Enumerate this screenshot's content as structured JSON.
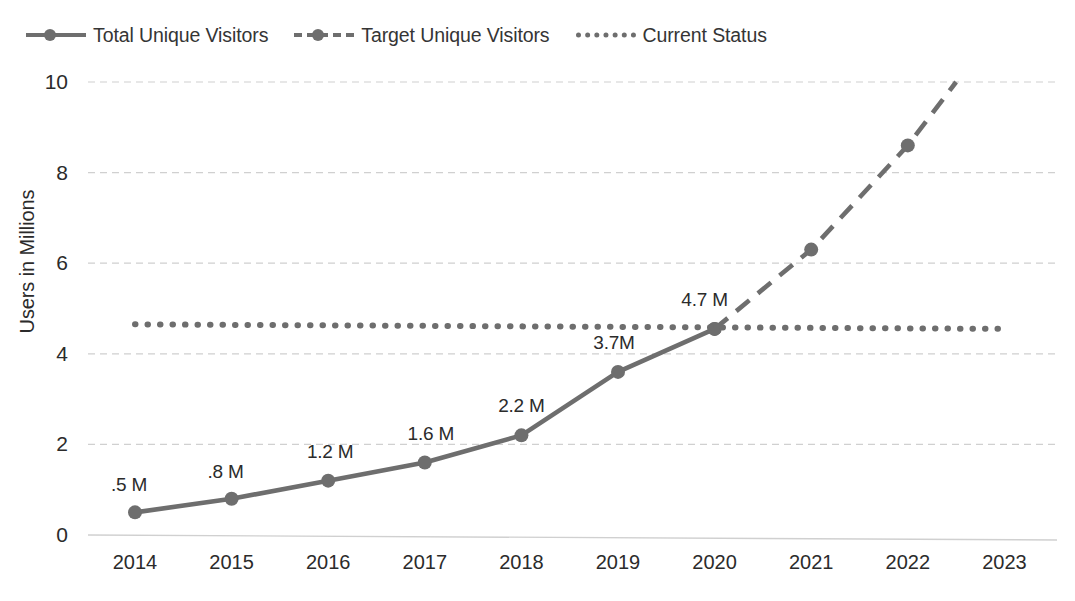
{
  "chart_data": {
    "type": "line",
    "title": "",
    "xlabel": "",
    "ylabel": "Users in Millions",
    "categories": [
      "2014",
      "2015",
      "2016",
      "2017",
      "2018",
      "2019",
      "2020",
      "2021",
      "2022",
      "2023"
    ],
    "ylim": [
      0,
      10
    ],
    "yticks": [
      "0",
      "2",
      "4",
      "6",
      "8",
      "10"
    ],
    "grid": true,
    "legend_position": "top-left",
    "series": [
      {
        "name": "Total Unique Visitors",
        "style": "solid",
        "color": "#6e6e6e",
        "x": [
          "2014",
          "2015",
          "2016",
          "2017",
          "2018",
          "2019",
          "2020"
        ],
        "values": [
          0.5,
          0.8,
          1.2,
          1.6,
          2.2,
          3.6,
          4.55
        ],
        "labels": [
          ".5 M",
          ".8 M",
          "1.2 M",
          "1.6 M",
          "2.2 M",
          "3.7M",
          "4.7 M"
        ]
      },
      {
        "name": "Target Unique Visitors",
        "style": "dashed",
        "color": "#6e6e6e",
        "x": [
          "2020",
          "2021",
          "2022",
          "2022.5"
        ],
        "values": [
          4.55,
          6.3,
          8.6,
          10.0
        ],
        "labels": [
          "",
          "",
          "",
          ""
        ]
      },
      {
        "name": "Current Status",
        "style": "dotted",
        "color": "#6e6e6e",
        "x": [
          "2014",
          "2023"
        ],
        "values": [
          4.65,
          4.55
        ],
        "labels": [
          "",
          ""
        ]
      }
    ]
  },
  "legend": {
    "items": [
      {
        "label": "Total Unique Visitors",
        "style": "solid",
        "marker": true
      },
      {
        "label": "Target Unique Visitors",
        "style": "dashed",
        "marker": true
      },
      {
        "label": "Current Status",
        "style": "dotted",
        "marker": false
      }
    ]
  },
  "colors": {
    "line": "#6e6e6e",
    "grid": "#d0d0d0",
    "text": "#2b2b2b"
  }
}
